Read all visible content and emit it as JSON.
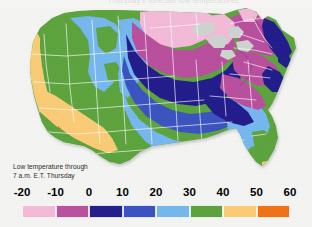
{
  "header": {
    "ghost_text": "Thursday's forecast low temperatures"
  },
  "caption": {
    "text": "Low temperature through\n7 a.m. E.T. Thursday"
  },
  "legend": {
    "ticks": [
      "-20",
      "-10",
      "0",
      "10",
      "20",
      "30",
      "40",
      "50",
      "60"
    ],
    "bands": [
      {
        "label": "-20 to -10",
        "color": "#f3bad8"
      },
      {
        "label": "-10 to 0",
        "color": "#b9509e"
      },
      {
        "label": "0 to 10",
        "color": "#241e8c"
      },
      {
        "label": "10 to 20",
        "color": "#3a52c0"
      },
      {
        "label": "20 to 30",
        "color": "#74b7ee"
      },
      {
        "label": "30 to 40",
        "color": "#5ba33e"
      },
      {
        "label": "40 to 50",
        "color": "#fbcb76"
      },
      {
        "label": "50 to 60",
        "color": "#ef7215"
      }
    ]
  },
  "map": {
    "title": "United States low temperature forecast map",
    "background_color": "#f4f4f2",
    "state_border_color": "#ffffff",
    "lake_color": "#cfd3d0",
    "regions": [
      {
        "name": "pacific-coast-strip",
        "band": "40 to 50",
        "color": "#fbcb76"
      },
      {
        "name": "southern-california-desert",
        "band": "50 to 60",
        "color": "#ef7215"
      },
      {
        "name": "pacific-northwest-inland",
        "band": "30 to 40",
        "color": "#5ba33e"
      },
      {
        "name": "northern-rockies",
        "band": "20 to 30",
        "color": "#74b7ee"
      },
      {
        "name": "northern-plains",
        "band": "-20 to -10",
        "color": "#f3bad8"
      },
      {
        "name": "upper-midwest",
        "band": "-10 to 0",
        "color": "#b9509e"
      },
      {
        "name": "great-lakes-band",
        "band": "0 to 10",
        "color": "#241e8c"
      },
      {
        "name": "ohio-valley",
        "band": "10 to 20",
        "color": "#3a52c0"
      },
      {
        "name": "mid-south",
        "band": "20 to 30",
        "color": "#74b7ee"
      },
      {
        "name": "texas",
        "band": "30 to 40",
        "color": "#5ba33e"
      },
      {
        "name": "gulf-coast",
        "band": "40 to 50",
        "color": "#fbcb76"
      },
      {
        "name": "florida-peninsula",
        "band": "30 to 40",
        "color": "#5ba33e"
      },
      {
        "name": "south-florida",
        "band": "40 to 50",
        "color": "#fbcb76"
      },
      {
        "name": "northeast",
        "band": "-10 to 0",
        "color": "#b9509e"
      },
      {
        "name": "new-england-coast",
        "band": "0 to 10",
        "color": "#241e8c"
      }
    ]
  },
  "chart_data": {
    "type": "heatmap",
    "title": "Low temperature through 7 a.m. E.T. Thursday",
    "xlabel": "",
    "ylabel": "",
    "units": "degrees Fahrenheit",
    "legend_position": "bottom",
    "grid": false,
    "categories": [
      "-20 to -10",
      "-10 to 0",
      "0 to 10",
      "10 to 20",
      "20 to 30",
      "30 to 40",
      "40 to 50",
      "50 to 60"
    ],
    "tick_values": [
      -20,
      -10,
      0,
      10,
      20,
      30,
      40,
      50,
      60
    ],
    "colors": [
      "#f3bad8",
      "#b9509e",
      "#241e8c",
      "#3a52c0",
      "#74b7ee",
      "#5ba33e",
      "#fbcb76",
      "#ef7215"
    ],
    "series": [
      {
        "name": "North Dakota",
        "value": -15
      },
      {
        "name": "Minnesota",
        "value": -15
      },
      {
        "name": "South Dakota",
        "value": -5
      },
      {
        "name": "Wisconsin",
        "value": -5
      },
      {
        "name": "Iowa",
        "value": -5
      },
      {
        "name": "Michigan",
        "value": -5
      },
      {
        "name": "Nebraska",
        "value": 5
      },
      {
        "name": "Illinois",
        "value": 5
      },
      {
        "name": "Indiana",
        "value": 5
      },
      {
        "name": "Ohio",
        "value": 5
      },
      {
        "name": "New York",
        "value": -5
      },
      {
        "name": "Pennsylvania",
        "value": -5
      },
      {
        "name": "New England coast",
        "value": 5
      },
      {
        "name": "Kansas",
        "value": 15
      },
      {
        "name": "Missouri",
        "value": 15
      },
      {
        "name": "Kentucky",
        "value": 15
      },
      {
        "name": "Tennessee",
        "value": 15
      },
      {
        "name": "Oklahoma",
        "value": 25
      },
      {
        "name": "Arkansas",
        "value": 25
      },
      {
        "name": "Mississippi",
        "value": 25
      },
      {
        "name": "Alabama",
        "value": 25
      },
      {
        "name": "Georgia",
        "value": 25
      },
      {
        "name": "Carolinas",
        "value": 25
      },
      {
        "name": "Texas",
        "value": 35
      },
      {
        "name": "Louisiana coast",
        "value": 45
      },
      {
        "name": "Florida peninsula",
        "value": 35
      },
      {
        "name": "South Florida",
        "value": 45
      },
      {
        "name": "Montana",
        "value": 25
      },
      {
        "name": "Wyoming",
        "value": 25
      },
      {
        "name": "Colorado",
        "value": 25
      },
      {
        "name": "Idaho",
        "value": 35
      },
      {
        "name": "Utah",
        "value": 35
      },
      {
        "name": "Nevada",
        "value": 35
      },
      {
        "name": "Oregon interior",
        "value": 35
      },
      {
        "name": "Washington interior",
        "value": 35
      },
      {
        "name": "Pacific coast",
        "value": 45
      },
      {
        "name": "Arizona low desert",
        "value": 55
      },
      {
        "name": "Southern California desert",
        "value": 55
      }
    ]
  }
}
